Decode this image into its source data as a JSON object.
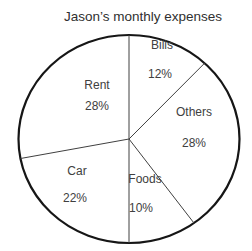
{
  "chart_data": {
    "type": "pie",
    "title": "Jason’s monthly expenses",
    "unit": "%",
    "direction": "clockwise",
    "start_angle_deg": 0,
    "style": "white slices with black outlines, labels inside slices",
    "slices": [
      {
        "label": "Bills",
        "value": 12,
        "label_pos": [
          162,
          46
        ],
        "pct_pos": [
          160,
          75
        ]
      },
      {
        "label": "Others",
        "value": 28,
        "label_pos": [
          194,
          113
        ],
        "pct_pos": [
          194,
          144
        ]
      },
      {
        "label": "Foods",
        "value": 10,
        "label_pos": [
          145,
          180
        ],
        "pct_pos": [
          141,
          209
        ]
      },
      {
        "label": "Car",
        "value": 22,
        "label_pos": [
          77,
          172
        ],
        "pct_pos": [
          75,
          199
        ]
      },
      {
        "label": "Rent",
        "value": 28,
        "label_pos": [
          97,
          86
        ],
        "pct_pos": [
          97,
          107
        ]
      }
    ],
    "layout": {
      "cx": 129,
      "cy": 139,
      "rx": 110.5,
      "ry": 104,
      "title_x": 143,
      "title_y": 21
    },
    "colors": {
      "background": "#ffffff",
      "outline": "#161616",
      "divider": "#404040",
      "text": "#404040",
      "title_text": "#303030",
      "slice_fill": "#ffffff"
    }
  }
}
